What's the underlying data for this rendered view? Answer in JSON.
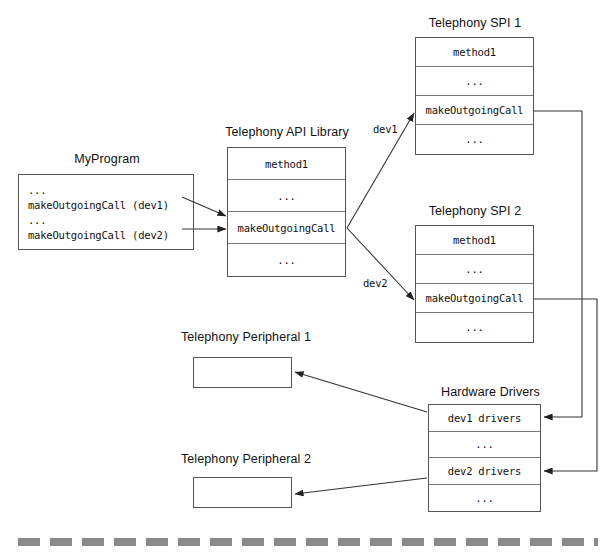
{
  "diagram": {
    "colors": {
      "box_border": "#555555",
      "row_divider": "#777777",
      "line": "#333333",
      "dash_rule": "#8a8a8a",
      "background": "#ffffff",
      "text": "#111111"
    },
    "nodes": {
      "my_program": {
        "caption": "MyProgram",
        "lines": [
          "...",
          "makeOutgoingCall (dev1)",
          "...",
          "makeOutgoingCall (dev2)"
        ]
      },
      "api_library": {
        "caption": "Telephony API Library",
        "rows": [
          "method1",
          "...",
          "makeOutgoingCall",
          "..."
        ]
      },
      "spi_1": {
        "caption": "Telephony SPI 1",
        "rows": [
          "method1",
          "...",
          "makeOutgoingCall",
          "..."
        ]
      },
      "spi_2": {
        "caption": "Telephony SPI 2",
        "rows": [
          "method1",
          "...",
          "makeOutgoingCall",
          "..."
        ]
      },
      "hardware_drivers": {
        "caption": "Hardware Drivers",
        "rows": [
          "dev1 drivers",
          "...",
          "dev2 drivers",
          "..."
        ]
      },
      "peripheral_1": {
        "caption": "Telephony Peripheral 1",
        "rows": []
      },
      "peripheral_2": {
        "caption": "Telephony Peripheral 2",
        "rows": []
      }
    },
    "edge_labels": {
      "dev1": "dev1",
      "dev2": "dev2"
    }
  }
}
